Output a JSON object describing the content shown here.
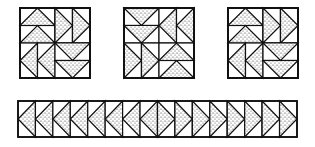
{
  "colors": {
    "line": "#111111",
    "stipple": "#222222",
    "background": "#ffffff"
  },
  "blocks": [
    {
      "name": "block-1",
      "x": 20,
      "y": 8,
      "size": 70,
      "quadrants": [
        {
          "q": "tl",
          "dir": "up"
        },
        {
          "q": "tr",
          "dir": "right"
        },
        {
          "q": "bl",
          "dir": "left"
        },
        {
          "q": "br",
          "dir": "down"
        }
      ]
    },
    {
      "name": "block-2",
      "x": 124,
      "y": 8,
      "size": 70,
      "quadrants": [
        {
          "q": "tl",
          "dir": "down"
        },
        {
          "q": "tr",
          "dir": "left"
        },
        {
          "q": "bl",
          "dir": "right"
        },
        {
          "q": "br",
          "dir": "up"
        }
      ]
    },
    {
      "name": "block-3",
      "x": 228,
      "y": 8,
      "size": 70,
      "quadrants": [
        {
          "q": "tl",
          "dir": "up"
        },
        {
          "q": "tr",
          "dir": "right"
        },
        {
          "q": "bl",
          "dir": "left"
        },
        {
          "q": "br",
          "dir": "down"
        }
      ]
    }
  ],
  "strip": {
    "name": "border-strip",
    "x": 18,
    "y": 101,
    "width": 279,
    "height": 36,
    "units": [
      "left",
      "left",
      "left",
      "left",
      "left",
      "left",
      "left",
      "left",
      "right",
      "right",
      "right",
      "right",
      "right",
      "right",
      "right",
      "right"
    ]
  }
}
